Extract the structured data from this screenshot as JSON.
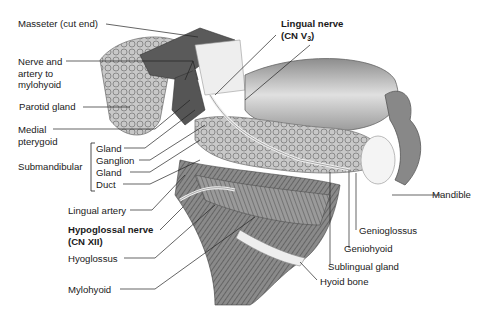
{
  "figure": {
    "type": "anatomical-illustration",
    "colors": {
      "ink": "#1a1a1a",
      "tissue_dark": "#6b6b6b",
      "tissue_mid": "#a8a8a8",
      "tissue_light": "#d9d9d9",
      "bone": "#f2f2f2"
    }
  },
  "labels": {
    "masseter": "Masseter (cut end)",
    "nerve_artery_1": "Nerve and",
    "nerve_artery_2": "artery to",
    "nerve_artery_3": "mylohyoid",
    "parotid": "Parotid gland",
    "medial_pterygoid_1": "Medial",
    "medial_pterygoid_2": "pterygoid",
    "submandibular_group": "Submandibular",
    "gland_1": "Gland",
    "ganglion": "Ganglion",
    "gland_2": "Gland",
    "duct": "Duct",
    "lingual_artery": "Lingual artery",
    "hypoglossal_1": "Hypoglossal nerve",
    "hypoglossal_2": "(CN XII)",
    "hyoglossus": "Hyoglossus",
    "mylohyoid": "Mylohyoid",
    "lingual_nerve_1": "Lingual nerve",
    "lingual_nerve_2_prefix": "(CN V",
    "lingual_nerve_2_sub": "3",
    "lingual_nerve_2_suffix": ")",
    "mandible": "Mandible",
    "genioglossus": "Genioglossus",
    "geniohyoid": "Geniohyoid",
    "sublingual": "Sublingual gland",
    "hyoid": "Hyoid bone"
  }
}
